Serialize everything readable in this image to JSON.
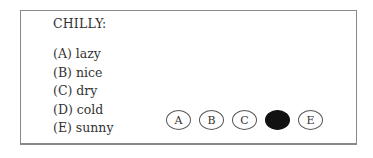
{
  "question": {
    "stem": "CHILLY:"
  },
  "options": [
    {
      "letter": "A",
      "text": "(A) lazy"
    },
    {
      "letter": "B",
      "text": "(B) nice"
    },
    {
      "letter": "C",
      "text": "(C) dry"
    },
    {
      "letter": "D",
      "text": "(D) cold"
    },
    {
      "letter": "E",
      "text": "(E) sunny"
    }
  ],
  "answer_bubbles": [
    {
      "label": "A",
      "filled": false
    },
    {
      "label": "B",
      "filled": false
    },
    {
      "label": "C",
      "filled": false
    },
    {
      "label": "D",
      "filled": true
    },
    {
      "label": "E",
      "filled": false
    }
  ],
  "selected_answer": "D"
}
